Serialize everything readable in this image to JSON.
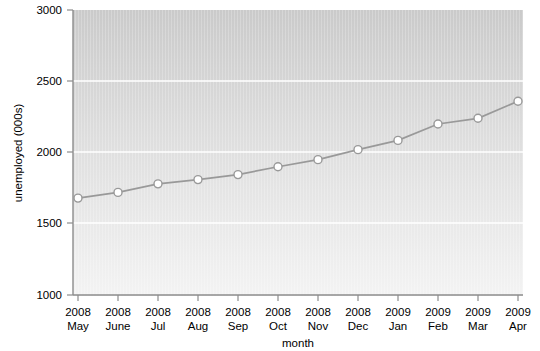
{
  "chart_data": {
    "type": "line",
    "title": "",
    "xlabel": "month",
    "ylabel": "unemployed (000s)",
    "categories": [
      "2008\nMay",
      "2008\nJune",
      "2008\nJul",
      "2008\nAug",
      "2008\nSep",
      "2008\nOct",
      "2008\nNov",
      "2008\nDec",
      "2009\nJan",
      "2009\nFeb",
      "2009\nMar",
      "2009\nApr"
    ],
    "x_tick_years": [
      "2008",
      "2008",
      "2008",
      "2008",
      "2008",
      "2008",
      "2008",
      "2008",
      "2009",
      "2009",
      "2009",
      "2009"
    ],
    "x_tick_months": [
      "May",
      "June",
      "Jul",
      "Aug",
      "Sep",
      "Oct",
      "Nov",
      "Dec",
      "Jan",
      "Feb",
      "Mar",
      "Apr"
    ],
    "values": [
      1680,
      1720,
      1780,
      1810,
      1845,
      1900,
      1950,
      2020,
      2085,
      2200,
      2240,
      2360
    ],
    "ylim": [
      1000,
      3000
    ],
    "y_ticks": [
      1000,
      1500,
      2000,
      2500,
      3000
    ],
    "y_tick_labels": [
      "1000",
      "1500",
      "2000",
      "2500",
      "3000"
    ],
    "grid": true,
    "grid_color": "#ffffff",
    "legend": null,
    "legend_position": "none",
    "series_color": "#999999",
    "marker_face_color": "#ffffff",
    "marker_edge_color": "#999999",
    "plot_bg_top": "#cccccc",
    "plot_bg_bottom": "#f2f2f2",
    "axis_color": "#808080"
  },
  "axes": {
    "y_axis_label": "unemployed (000s)",
    "x_axis_label": "month"
  }
}
